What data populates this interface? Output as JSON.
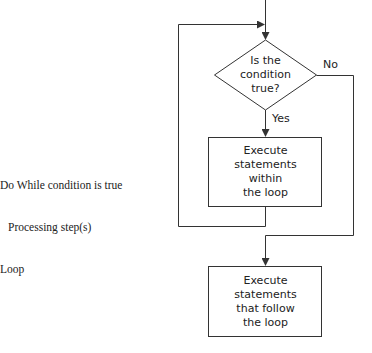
{
  "pseudocode": {
    "lines": [
      "Do While condition is true",
      "Processing step(s)",
      "Loop"
    ]
  },
  "flowchart": {
    "decision": {
      "lines": [
        "Is the",
        "condition",
        "true?"
      ]
    },
    "yes_label": "Yes",
    "no_label": "No",
    "loop_body": {
      "lines": [
        "Execute",
        "statements",
        "within",
        "the loop"
      ]
    },
    "after_loop": {
      "lines": [
        "Execute",
        "statements",
        "that follow",
        "the loop"
      ]
    }
  },
  "colors": {
    "line": "#333333",
    "text": "#222222",
    "background": "#ffffff"
  }
}
